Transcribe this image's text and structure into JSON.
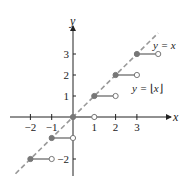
{
  "chart_data": {
    "type": "line",
    "title": "",
    "xlabel": "x",
    "ylabel": "y",
    "xlim": [
      -2.6,
      4.3
    ],
    "ylim": [
      -2.8,
      4.0
    ],
    "grid": false,
    "x_ticks": [
      -2,
      -1,
      1,
      2,
      3
    ],
    "x_tick_labels": [
      "−2",
      "−1",
      "1",
      "2",
      "3"
    ],
    "y_ticks": [
      3,
      2,
      1,
      -2
    ],
    "y_tick_labels": [
      "3",
      "2",
      "1",
      "−2"
    ],
    "series": [
      {
        "name": "y = ⌊x⌋",
        "style": "step",
        "color": "#888888",
        "segments": [
          {
            "x_start": -2,
            "x_end": -1,
            "y": -2,
            "start_closed": true,
            "end_closed": false
          },
          {
            "x_start": -1,
            "x_end": 0,
            "y": -1,
            "start_closed": true,
            "end_closed": false
          },
          {
            "x_start": 0,
            "x_end": 1,
            "y": 0,
            "start_closed": true,
            "end_closed": false
          },
          {
            "x_start": 1,
            "x_end": 2,
            "y": 1,
            "start_closed": true,
            "end_closed": false
          },
          {
            "x_start": 2,
            "x_end": 3,
            "y": 2,
            "start_closed": true,
            "end_closed": false
          },
          {
            "x_start": 3,
            "x_end": 4,
            "y": 3,
            "start_closed": true,
            "end_closed": false
          }
        ]
      },
      {
        "name": "y = x",
        "style": "dashed",
        "color": "#999999",
        "x": [
          -2.7,
          4.0
        ],
        "y": [
          -2.7,
          4.0
        ]
      }
    ],
    "annotations": [
      {
        "text": "y = x",
        "near": "top-right, end of dashed line"
      },
      {
        "text": "y = [x]",
        "near": "right, below step at y=2"
      }
    ]
  },
  "labels": {
    "x_axis": "x",
    "y_axis": "y",
    "line_label": "y = x",
    "floor_label_prefix": "y = ",
    "floor_label_var": "x"
  }
}
